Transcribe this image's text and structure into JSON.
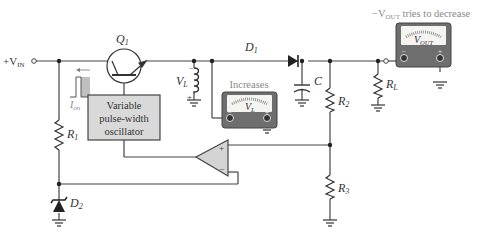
{
  "diagram": {
    "colors": {
      "wire": "#444444",
      "oscillator_fill": "#d9d9d9",
      "opamp_fill": "#d4d4d4",
      "meter_body": "#6e6e6e",
      "meter_face": "#f4f4f0",
      "pulse_fill": "#bfbfbf",
      "annotation_text": "#8a8a8a"
    },
    "labels": {
      "vin_prefix": "+V",
      "vin_sub": "IN",
      "q1": "Q",
      "q1_sub": "1",
      "d1": "D",
      "d1_sub": "1",
      "d2": "D",
      "d2_sub": "2",
      "r1": "R",
      "r1_sub": "1",
      "r2": "R",
      "r2_sub": "2",
      "r3": "R",
      "r3_sub": "3",
      "rl": "R",
      "rl_sub": "L",
      "c": "C",
      "vl": "V",
      "vl_sub": "L",
      "ion": "I",
      "ion_sub": "on",
      "oscillator_line1": "Variable",
      "oscillator_line2": "pulse-width",
      "oscillator_line3": "oscillator",
      "opamp_plus": "+",
      "opamp_minus": "−",
      "inductor_minus": "−",
      "inductor_plus": "+"
    },
    "meters": [
      {
        "name": "vl-meter",
        "annotation": "Increases",
        "face_label": "V",
        "face_sub": "L",
        "minus": "−",
        "plus": "+"
      },
      {
        "name": "vout-meter",
        "annotation_prefix": "−V",
        "annotation_sub": "OUT",
        "annotation_suffix": " tries to decrease",
        "face_label": "V",
        "face_sub": "OUT",
        "minus": "−",
        "plus": "+"
      }
    ]
  }
}
